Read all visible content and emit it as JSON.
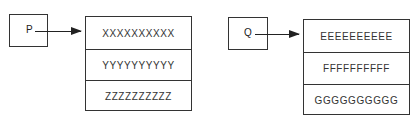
{
  "diagram": {
    "left": {
      "pointer": {
        "label": "P"
      },
      "rows": [
        {
          "value": "XXXXXXXXXX"
        },
        {
          "value": "YYYYYYYYYY"
        },
        {
          "value": "ZZZZZZZZZZ"
        }
      ]
    },
    "right": {
      "pointer": {
        "label": "Q"
      },
      "rows": [
        {
          "value": "EEEEEEEEEE"
        },
        {
          "value": "FFFFFFFFFF"
        },
        {
          "value": "GGGGGGGGGG"
        }
      ]
    }
  }
}
